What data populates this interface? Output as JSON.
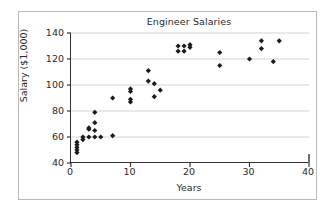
{
  "chart_data": {
    "type": "scatter",
    "title": "Engineer Salaries",
    "xlabel": "Years",
    "ylabel": "Salary ($1,000)",
    "xlim": [
      0,
      40
    ],
    "ylim": [
      40,
      140
    ],
    "xticks": [
      0,
      10,
      20,
      30,
      40
    ],
    "yticks": [
      40,
      60,
      80,
      100,
      120,
      140
    ],
    "grid": "horizontal",
    "legend": "none",
    "marker": "diamond",
    "marker_color": "#1b1b1b",
    "points": [
      {
        "x": 1,
        "y": 48
      },
      {
        "x": 1,
        "y": 50
      },
      {
        "x": 1,
        "y": 52
      },
      {
        "x": 1,
        "y": 54
      },
      {
        "x": 1,
        "y": 56
      },
      {
        "x": 2,
        "y": 58
      },
      {
        "x": 2,
        "y": 60
      },
      {
        "x": 3,
        "y": 66
      },
      {
        "x": 3,
        "y": 67
      },
      {
        "x": 3,
        "y": 60
      },
      {
        "x": 4,
        "y": 79
      },
      {
        "x": 4,
        "y": 71
      },
      {
        "x": 4,
        "y": 65
      },
      {
        "x": 4,
        "y": 60
      },
      {
        "x": 5,
        "y": 60
      },
      {
        "x": 7,
        "y": 90
      },
      {
        "x": 7,
        "y": 61
      },
      {
        "x": 10,
        "y": 97
      },
      {
        "x": 10,
        "y": 95
      },
      {
        "x": 10,
        "y": 89
      },
      {
        "x": 10,
        "y": 87
      },
      {
        "x": 13,
        "y": 111
      },
      {
        "x": 13,
        "y": 103
      },
      {
        "x": 14,
        "y": 101
      },
      {
        "x": 14,
        "y": 91
      },
      {
        "x": 15,
        "y": 96
      },
      {
        "x": 18,
        "y": 130
      },
      {
        "x": 18,
        "y": 126
      },
      {
        "x": 19,
        "y": 130
      },
      {
        "x": 19,
        "y": 126
      },
      {
        "x": 20,
        "y": 131
      },
      {
        "x": 20,
        "y": 129
      },
      {
        "x": 25,
        "y": 125
      },
      {
        "x": 25,
        "y": 115
      },
      {
        "x": 30,
        "y": 120
      },
      {
        "x": 32,
        "y": 134
      },
      {
        "x": 32,
        "y": 128
      },
      {
        "x": 34,
        "y": 118
      },
      {
        "x": 35,
        "y": 134
      }
    ]
  }
}
